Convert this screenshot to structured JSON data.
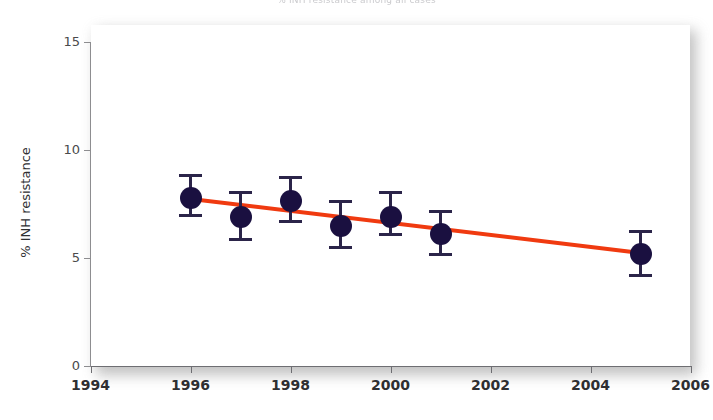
{
  "chart_data": {
    "type": "scatter",
    "title": "% INH resistance among all cases",
    "xlabel": "",
    "ylabel": "% INH resistance",
    "xlim": [
      1994,
      2006
    ],
    "ylim": [
      0,
      15
    ],
    "xticks": [
      1994,
      1996,
      1998,
      2000,
      2002,
      2004,
      2006
    ],
    "yticks": [
      0,
      5,
      10,
      15
    ],
    "grid": false,
    "legend": "none",
    "x": [
      1996,
      1997,
      1998,
      1999,
      2000,
      2001,
      2005
    ],
    "values": [
      7.8,
      6.9,
      7.65,
      6.5,
      6.9,
      6.1,
      5.2
    ],
    "error_low": [
      6.9,
      5.8,
      6.6,
      5.4,
      6.0,
      5.1,
      4.1
    ],
    "error_high": [
      8.9,
      8.1,
      8.8,
      7.7,
      8.1,
      7.2,
      6.3
    ],
    "series": [
      {
        "name": "% INH resistance",
        "marker": "filled-circle",
        "color": "#1a1040",
        "values": [
          7.8,
          6.9,
          7.65,
          6.5,
          6.9,
          6.1,
          5.2
        ]
      },
      {
        "name": "linear trend",
        "type": "line",
        "color": "#f03a10",
        "x": [
          1996,
          2005
        ],
        "values": [
          7.75,
          5.25
        ]
      }
    ],
    "annotations": []
  },
  "axis": {
    "y_title": "% INH resistance",
    "y_ticks": [
      "0",
      "5",
      "10",
      "15"
    ],
    "x_ticks": [
      "1994",
      "1996",
      "1998",
      "2000",
      "2002",
      "2004",
      "2006"
    ]
  },
  "colors": {
    "marker": "#1a1040",
    "errorbar": "#2b2449",
    "trendline": "#f03a10",
    "axis": "#6e6e72",
    "panel": "#ffffff"
  }
}
